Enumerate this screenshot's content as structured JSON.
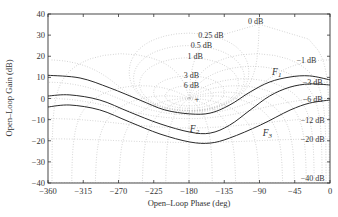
{
  "chart_data": {
    "type": "line",
    "subtype": "nichols-chart",
    "title": "",
    "xlabel": "Open–Loop Phase (deg)",
    "ylabel": "Open–Loop Gain (dB)",
    "xlim": [
      -360,
      0
    ],
    "ylim": [
      -40,
      40
    ],
    "xticks": [
      -360,
      -315,
      -270,
      -225,
      -180,
      -135,
      -90,
      -45,
      0
    ],
    "xtick_labels": [
      "−360",
      "−315",
      "−270",
      "−225",
      "−180",
      "−135",
      "−90",
      "−45",
      "0"
    ],
    "yticks": [
      40,
      30,
      20,
      10,
      0,
      -10,
      -20,
      -30,
      -40
    ],
    "ytick_labels": [
      "40",
      "30",
      "20",
      "10",
      "0",
      "−10",
      "−20",
      "−30",
      "−40"
    ],
    "grid": "nichols dotted",
    "critical_point_marker": {
      "symbol": "+",
      "phase": -180,
      "gain": 0
    },
    "contour_labels": [
      {
        "text": "0 dB",
        "phase": -95,
        "gain": 36.5
      },
      {
        "text": "0.25 dB",
        "phase": -152,
        "gain": 30
      },
      {
        "text": "0.5 dB",
        "phase": -164,
        "gain": 25.5
      },
      {
        "text": "1 dB",
        "phase": -172,
        "gain": 20
      },
      {
        "text": "3 dB",
        "phase": -177,
        "gain": 11
      },
      {
        "text": "6 dB",
        "phase": -177,
        "gain": 6.5
      },
      {
        "text": "−1 dB",
        "phase": -30,
        "gain": 18
      },
      {
        "text": "−3 dB",
        "phase": -22,
        "gain": 8
      },
      {
        "text": "−6 dB",
        "phase": -22,
        "gain": 0
      },
      {
        "text": "−12 dB",
        "phase": -22,
        "gain": -10
      },
      {
        "text": "−20 dB",
        "phase": -22,
        "gain": -19
      },
      {
        "text": "−40 dB",
        "phase": -22,
        "gain": -37.5
      }
    ],
    "series": [
      {
        "name": "F1",
        "label_pos": {
          "phase": -68,
          "gain": 12.5
        },
        "x": [
          -360,
          -319,
          -281,
          -243,
          -211,
          -179,
          -153,
          -128,
          -102,
          -77,
          -51,
          -26,
          0
        ],
        "y": [
          11,
          9.7,
          5,
          -0.7,
          -5.4,
          -7.3,
          -6.9,
          -3.1,
          3.1,
          7.8,
          10.2,
          10.7,
          8.8
        ]
      },
      {
        "name": "F2",
        "label_pos": {
          "phase": -173,
          "gain": -14.5
        },
        "x": [
          -360,
          -332,
          -294,
          -256,
          -217,
          -179,
          -153,
          -128,
          -102,
          -77,
          -51,
          -26,
          0
        ],
        "y": [
          1.2,
          1.7,
          -0.7,
          -6.4,
          -12,
          -15.9,
          -16.4,
          -12.6,
          -5.5,
          1.2,
          5.4,
          6.9,
          6.4
        ]
      },
      {
        "name": "F3",
        "label_pos": {
          "phase": -80,
          "gain": -16.5
        },
        "x": [
          -360,
          -332,
          -294,
          -256,
          -217,
          -179,
          -153,
          -128,
          -89,
          -51,
          -26,
          0
        ],
        "y": [
          -4,
          -3.1,
          -5.4,
          -11.1,
          -16.8,
          -20.6,
          -21.1,
          -18.7,
          -12.6,
          -5.5,
          -2.2,
          -0.7
        ]
      }
    ]
  }
}
